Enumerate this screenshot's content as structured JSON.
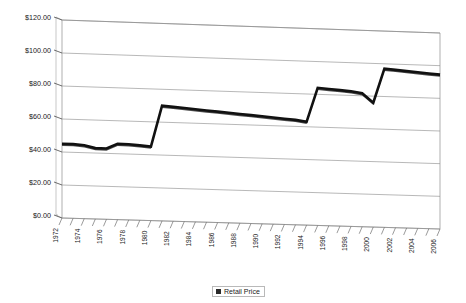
{
  "chart_data": {
    "type": "line",
    "title": "",
    "xlabel": "",
    "ylabel": "",
    "ylim": [
      0,
      120
    ],
    "ytick_interval": 20,
    "grid": true,
    "legend_position": "bottom-center",
    "style": "3d-perspective-line",
    "series_color": "#2b2b2b",
    "y_tick_labels": [
      "$120.00",
      "$100.00",
      "$80.00",
      "$60.00",
      "$40.00",
      "$20.00",
      "$0.00"
    ],
    "y_tick_values": [
      120,
      100,
      80,
      60,
      40,
      20,
      0
    ],
    "x_tick_labels": [
      "1972",
      "1974",
      "1976",
      "1978",
      "1980",
      "1982",
      "1984",
      "1986",
      "1988",
      "1990",
      "1992",
      "1994",
      "1996",
      "1998",
      "2000",
      "2002",
      "2004",
      "2006"
    ],
    "categories": [
      1972,
      1973,
      1974,
      1975,
      1976,
      1977,
      1978,
      1979,
      1980,
      1981,
      1982,
      1983,
      1984,
      1985,
      1986,
      1987,
      1988,
      1989,
      1990,
      1991,
      1992,
      1993,
      1994,
      1995,
      1996,
      1997,
      1998,
      1999,
      2000,
      2001,
      2002,
      2003,
      2004,
      2005,
      2006
    ],
    "series": [
      {
        "name": "Retail Price",
        "values": [
          45,
          45,
          44.5,
          43,
          43,
          46,
          46,
          45.5,
          45,
          70,
          69.5,
          69,
          68.5,
          68,
          67.5,
          67,
          66.5,
          66,
          65.5,
          65,
          64.5,
          64,
          63,
          84,
          83.5,
          83,
          82.5,
          81.5,
          76,
          97,
          96.5,
          96,
          95.5,
          95,
          94.5
        ]
      }
    ],
    "legend": [
      {
        "label": "Retail Price",
        "color": "#2b2b2b"
      }
    ]
  }
}
